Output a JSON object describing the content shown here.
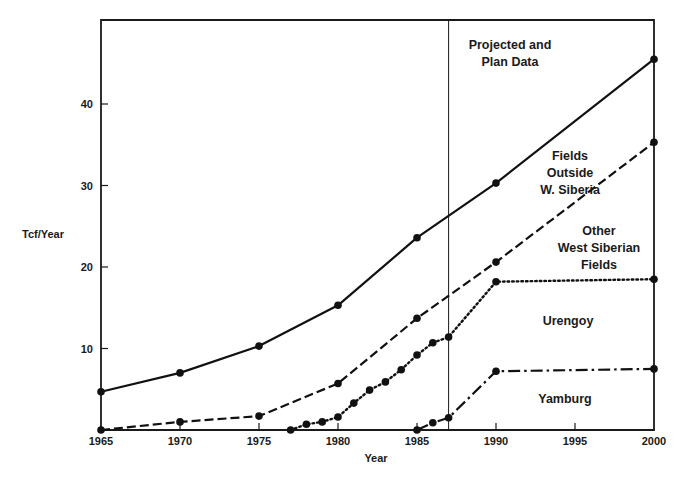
{
  "chart_data": {
    "type": "line",
    "title": "",
    "xlabel": "Year",
    "ylabel": "Tcf/Year",
    "xlim": [
      1965,
      2000
    ],
    "ylim": [
      0,
      49
    ],
    "x_ticks": [
      1965,
      1970,
      1975,
      1980,
      1985,
      1990,
      1995,
      2000
    ],
    "y_ticks": [
      10,
      20,
      30,
      40
    ],
    "grid": false,
    "legend": "none (inline annotations)",
    "divider": {
      "x": 1987,
      "label": [
        "Projected and",
        "Plan Data"
      ]
    },
    "series": [
      {
        "name": "Fields Outside W. Siberia",
        "style": "solid",
        "points": [
          [
            1965,
            4.7
          ],
          [
            1970,
            7.0
          ],
          [
            1975,
            10.3
          ],
          [
            1980,
            15.3
          ],
          [
            1985,
            23.6
          ],
          [
            1990,
            30.3
          ],
          [
            2000,
            45.5
          ]
        ]
      },
      {
        "name": "Other West Siberian Fields",
        "style": "dashed",
        "points": [
          [
            1965,
            0
          ],
          [
            1970,
            1.0
          ],
          [
            1975,
            1.7
          ],
          [
            1980,
            5.7
          ],
          [
            1985,
            13.7
          ],
          [
            1990,
            20.6
          ],
          [
            2000,
            35.3
          ]
        ]
      },
      {
        "name": "Urengoy",
        "style": "dotted",
        "points": [
          [
            1977,
            0
          ],
          [
            1978,
            0.7
          ],
          [
            1979,
            1.0
          ],
          [
            1980,
            1.6
          ],
          [
            1981,
            3.3
          ],
          [
            1982,
            4.9
          ],
          [
            1983,
            5.9
          ],
          [
            1984,
            7.4
          ],
          [
            1985,
            9.2
          ],
          [
            1986,
            10.7
          ],
          [
            1987,
            11.4
          ],
          [
            1990,
            18.2
          ],
          [
            2000,
            18.5
          ]
        ]
      },
      {
        "name": "Yamburg",
        "style": "dash-dot",
        "points": [
          [
            1985,
            0
          ],
          [
            1986,
            0.9
          ],
          [
            1987,
            1.5
          ],
          [
            1990,
            7.2
          ],
          [
            2000,
            7.5
          ]
        ]
      }
    ],
    "annotations": [
      {
        "lines": [
          "Projected and",
          "Plan Data"
        ],
        "x": 510,
        "y": 49
      },
      {
        "lines": [
          "Fields",
          "Outside",
          "W. Siberia"
        ],
        "x": 570,
        "y": 160
      },
      {
        "lines": [
          "Other",
          "West Siberian",
          "Fields"
        ],
        "x": 599,
        "y": 235
      },
      {
        "lines": [
          "Urengoy"
        ],
        "x": 568,
        "y": 325
      },
      {
        "lines": [
          "Yamburg"
        ],
        "x": 565,
        "y": 403
      }
    ]
  },
  "labels": {
    "ylabel": "Tcf/Year",
    "xlabel": "Year"
  }
}
